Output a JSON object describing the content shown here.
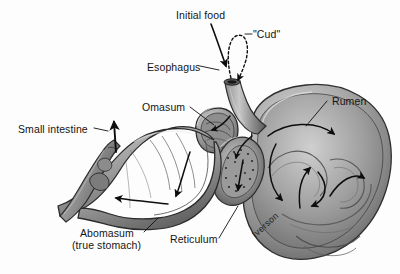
{
  "figure": {
    "background_color": "#fdfdfd",
    "ink_color": "#141414",
    "artist_signature": "Iverson"
  },
  "labels": [
    {
      "id": "initial-food",
      "text": "Initial food",
      "x": 176,
      "y": 9,
      "leader": "arrow-down-right"
    },
    {
      "id": "cud",
      "text": "\"Cud\"",
      "x": 253,
      "y": 29,
      "leader": "dash-left"
    },
    {
      "id": "esophagus",
      "text": "Esophagus",
      "x": 147,
      "y": 62,
      "leader": "dash-right"
    },
    {
      "id": "omasum",
      "text": "Omasum",
      "x": 142,
      "y": 102,
      "leader": "line-down-right"
    },
    {
      "id": "rumen",
      "text": "Rumen",
      "x": 330,
      "y": 96,
      "leader": "line-down-left"
    },
    {
      "id": "small-intestine",
      "text": "Small intestine",
      "x": 18,
      "y": 124,
      "leader": "dash-right"
    },
    {
      "id": "abomasum-1",
      "text": "Abomasum",
      "x": 80,
      "y": 228,
      "leader": "line-up-right"
    },
    {
      "id": "abomasum-2",
      "text": "(true stomach)",
      "x": 72,
      "y": 240,
      "leader": "none"
    },
    {
      "id": "reticulum",
      "text": "Reticulum",
      "x": 170,
      "y": 234,
      "leader": "line-up-right"
    }
  ],
  "signature": {
    "text": "Iverson",
    "x": 250,
    "y": 232
  },
  "anatomy_parts": [
    "esophagus",
    "rumen",
    "reticulum",
    "omasum",
    "abomasum",
    "small intestine"
  ],
  "flow": {
    "initial_food_direction": "down into esophagus",
    "cud_direction": "up out of esophagus and back down",
    "rumen_circulation": "clockwise mixing swirls",
    "outflow": "abomasum to small intestine (upward arrow)"
  }
}
